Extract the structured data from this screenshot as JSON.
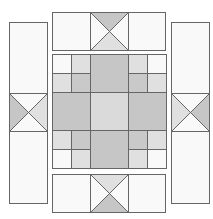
{
  "diagram": {
    "colors": {
      "stroke": "#666666",
      "white": "#f9f9f9",
      "light": "#e2e2e2",
      "medium": "#c6c6c6",
      "center": "#dadada",
      "background": "#ffffff"
    },
    "pieces": [
      {
        "name": "top-border-panel"
      },
      {
        "name": "bottom-border-panel"
      },
      {
        "name": "left-border-panel"
      },
      {
        "name": "right-border-panel"
      },
      {
        "name": "center-block"
      }
    ]
  }
}
